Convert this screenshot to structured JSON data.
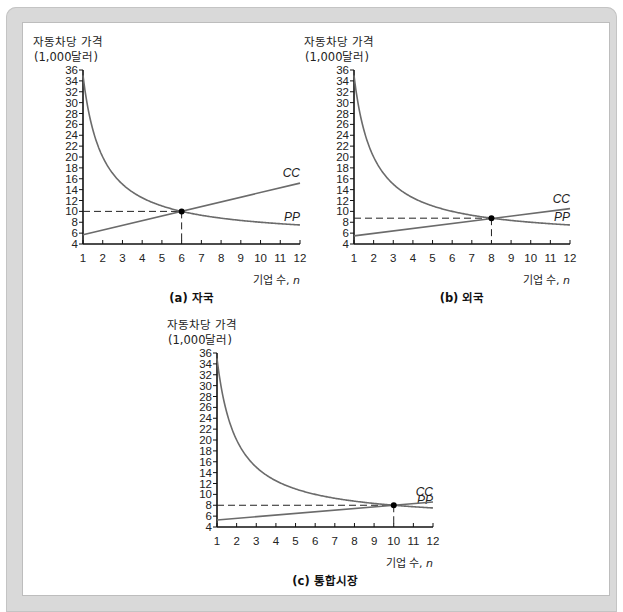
{
  "colors": {
    "curve": "#6b6b6b",
    "axis": "#111111",
    "dash": "#222222",
    "point": "#000000"
  },
  "chart_data": [
    {
      "id": "a",
      "type": "line",
      "caption": "(a) 자국",
      "ylabel_line1": "자동차당 가격",
      "ylabel_line2": "(1,000달러)",
      "xlabel": "기업 수, n",
      "xlabel_text": "기업 수, ",
      "xlabel_var": "n",
      "xlim": [
        1,
        12
      ],
      "ylim": [
        4,
        36
      ],
      "xticks": [
        1,
        2,
        3,
        4,
        5,
        6,
        7,
        8,
        9,
        10,
        11,
        12
      ],
      "yticks": [
        4,
        6,
        8,
        10,
        12,
        14,
        16,
        18,
        20,
        22,
        24,
        26,
        28,
        30,
        32,
        34,
        36
      ],
      "series": [
        {
          "name": "PP",
          "label": "PP",
          "kind": "hyperbola",
          "a": 5,
          "b": 30,
          "x": [
            1,
            2,
            3,
            4,
            5,
            6,
            7,
            8,
            9,
            10,
            11,
            12
          ],
          "values": [
            35,
            20,
            15,
            12.5,
            11,
            10,
            9.29,
            8.75,
            8.33,
            8,
            7.73,
            7.5
          ]
        },
        {
          "name": "CC",
          "label": "CC",
          "kind": "linear",
          "y_at_1": 5.7,
          "y_at_12": 15.2,
          "x": [
            1,
            12
          ],
          "values": [
            5.7,
            15.2
          ]
        }
      ],
      "equilibrium": {
        "n": 6,
        "price": 10
      }
    },
    {
      "id": "b",
      "type": "line",
      "caption": "(b) 외국",
      "ylabel_line1": "자동차당 가격",
      "ylabel_line2": "(1,000달러)",
      "xlabel": "기업 수, n",
      "xlabel_text": "기업 수, ",
      "xlabel_var": "n",
      "xlim": [
        1,
        12
      ],
      "ylim": [
        4,
        36
      ],
      "xticks": [
        1,
        2,
        3,
        4,
        5,
        6,
        7,
        8,
        9,
        10,
        11,
        12
      ],
      "yticks": [
        4,
        6,
        8,
        10,
        12,
        14,
        16,
        18,
        20,
        22,
        24,
        26,
        28,
        30,
        32,
        34,
        36
      ],
      "series": [
        {
          "name": "PP",
          "label": "PP",
          "kind": "hyperbola",
          "a": 5,
          "b": 30,
          "x": [
            1,
            2,
            3,
            4,
            5,
            6,
            7,
            8,
            9,
            10,
            11,
            12
          ],
          "values": [
            35,
            20,
            15,
            12.5,
            11,
            10,
            9.29,
            8.75,
            8.33,
            8,
            7.73,
            7.5
          ]
        },
        {
          "name": "CC",
          "label": "CC",
          "kind": "linear",
          "y_at_1": 5.5,
          "y_at_12": 10.5,
          "x": [
            1,
            12
          ],
          "values": [
            5.5,
            10.5
          ]
        }
      ],
      "equilibrium": {
        "n": 8,
        "price": 8.75
      }
    },
    {
      "id": "c",
      "type": "line",
      "caption": "(c) 통합시장",
      "ylabel_line1": "자동차당 가격",
      "ylabel_line2": "(1,000달러)",
      "xlabel": "기업 수, n",
      "xlabel_text": "기업 수, ",
      "xlabel_var": "n",
      "xlim": [
        1,
        12
      ],
      "ylim": [
        4,
        36
      ],
      "xticks": [
        1,
        2,
        3,
        4,
        5,
        6,
        7,
        8,
        9,
        10,
        11,
        12
      ],
      "yticks": [
        4,
        6,
        8,
        10,
        12,
        14,
        16,
        18,
        20,
        22,
        24,
        26,
        28,
        30,
        32,
        34,
        36
      ],
      "series": [
        {
          "name": "PP",
          "label": "PP",
          "kind": "hyperbola",
          "a": 5,
          "b": 30,
          "x": [
            1,
            2,
            3,
            4,
            5,
            6,
            7,
            8,
            9,
            10,
            11,
            12
          ],
          "values": [
            35,
            20,
            15,
            12.5,
            11,
            10,
            9.29,
            8.75,
            8.33,
            8,
            7.73,
            7.5
          ]
        },
        {
          "name": "CC",
          "label": "CC",
          "kind": "linear",
          "y_at_1": 5.3,
          "y_at_12": 8.6,
          "x": [
            1,
            12
          ],
          "values": [
            5.3,
            8.6
          ]
        }
      ],
      "equilibrium": {
        "n": 10,
        "price": 8
      }
    }
  ]
}
